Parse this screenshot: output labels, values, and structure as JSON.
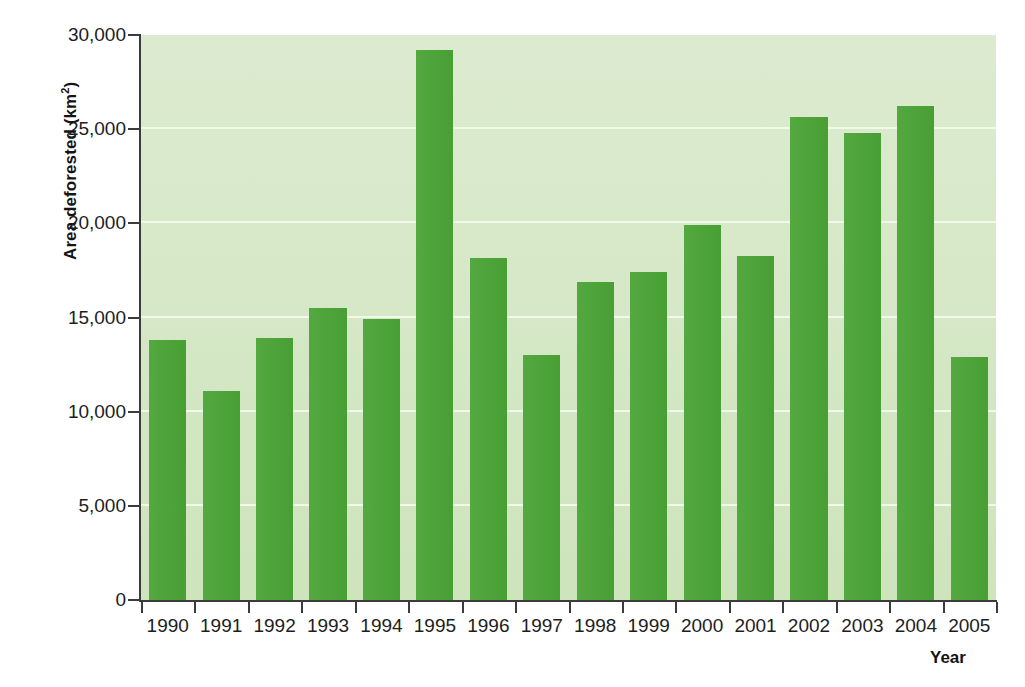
{
  "chart_data": {
    "type": "bar",
    "title": "",
    "xlabel": "Year",
    "ylabel": "Area deforested (km²)",
    "categories": [
      "1990",
      "1991",
      "1992",
      "1993",
      "1994",
      "1995",
      "1996",
      "1997",
      "1998",
      "1999",
      "2000",
      "2001",
      "2002",
      "2003",
      "2004",
      "2005"
    ],
    "values": [
      13800,
      11100,
      13900,
      15500,
      14900,
      29200,
      18150,
      13000,
      16900,
      17400,
      19900,
      18250,
      25650,
      24800,
      26250,
      12900
    ],
    "ylim": [
      0,
      30000
    ],
    "ytick_values": [
      0,
      5000,
      10000,
      15000,
      20000,
      25000,
      30000
    ],
    "ytick_labels": [
      "0",
      "5,000",
      "10,000",
      "15,000",
      "20,000",
      "25,000",
      "30,000"
    ],
    "grid": true,
    "legend": null,
    "bar_color": "#4aa435",
    "plot_background": "#d6e8c6",
    "gridline_color": "#f4faee",
    "axis_color": "#3b3b3b"
  },
  "axes": {
    "y_title_main": "Area deforested (km",
    "y_title_sup": "2",
    "y_title_close": ")",
    "x_title": "Year"
  }
}
